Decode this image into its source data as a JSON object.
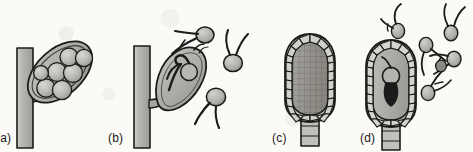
{
  "figure": {
    "background_color": "#fbfaf7",
    "ink_color": "#1b1b1b",
    "fill_light": "#d6d4cf",
    "fill_mid": "#b3b1ac",
    "fill_dark": "#949490",
    "width": 473,
    "height": 152
  },
  "panels": [
    {
      "id": "a",
      "label": "(a)",
      "label_x": 0,
      "label_y": 131,
      "caption": "Sporangium containing spores borne on a hypha",
      "structures": {
        "hypha": "vertical-hypha",
        "sporangium": "tilted-oval-sporangium",
        "spore_count": 7
      }
    },
    {
      "id": "b",
      "label": "(b)",
      "label_x": 108,
      "label_y": 131,
      "caption": "Sporangium discharging biflagellate zoospores",
      "structures": {
        "hypha": "vertical-hypha",
        "sporangium": "emptying-sporangium",
        "released_zoospore_count": 3,
        "flagella_per_zoospore": 2
      }
    },
    {
      "id": "c",
      "label": "(c)",
      "label_x": 272,
      "label_y": 131,
      "caption": "Elongate multicellular sporangium on a stalk",
      "structures": {
        "stalk": "short-stalk",
        "sporangium": "elongate-celled-sporangium",
        "wall_cell_count": 24
      }
    },
    {
      "id": "d",
      "label": "(d)",
      "label_x": 360,
      "label_y": 131,
      "caption": "Elongate sporangium releasing zoospores",
      "structures": {
        "stalk": "short-stalk",
        "sporangium": "elongate-celled-sporangium",
        "released_zoospore_count": 6,
        "flagella_per_zoospore": 2
      }
    }
  ]
}
